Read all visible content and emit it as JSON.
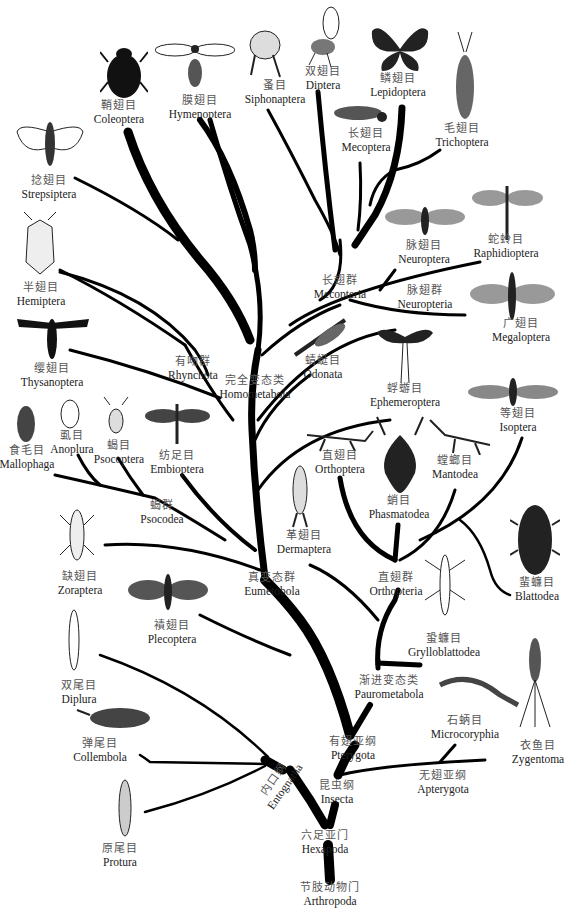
{
  "root": {
    "zh": "节肢动物门",
    "en": "Arthropoda"
  },
  "clades": {
    "hexapoda": {
      "zh": "六足亚门",
      "en": "Hexapoda"
    },
    "insecta": {
      "zh": "昆虫纲",
      "en": "Insecta"
    },
    "entognatha": {
      "zh": "内口纲",
      "en": "Entognatha"
    },
    "pterygota": {
      "zh": "有翅亚纲",
      "en": "Pterygota"
    },
    "apterygota": {
      "zh": "无翅亚纲",
      "en": "Apterygota"
    },
    "paurometabola": {
      "zh": "渐进变态类",
      "en": "Paurometabola"
    },
    "eumetabola": {
      "zh": "真变态群",
      "en": "Eumetobola"
    },
    "orthopteria": {
      "zh": "直翅群",
      "en": "Orthopteria"
    },
    "psocodea": {
      "zh": "蝎群",
      "en": "Psocodea"
    },
    "homometabola": {
      "zh": "完全变态类",
      "en": "Homometabola"
    },
    "rhynchota": {
      "zh": "有吻群",
      "en": "Rhynchota"
    },
    "mecopteria": {
      "zh": "长翅群",
      "en": "Mecopteria"
    },
    "neuropteria": {
      "zh": "脉翅群",
      "en": "Neuropteria"
    }
  },
  "orders": {
    "coleoptera": {
      "zh": "鞘翅目",
      "en": "Coleoptera"
    },
    "hymenoptera": {
      "zh": "膜翅目",
      "en": "Hymenoptera"
    },
    "siphonaptera": {
      "zh": "蚤目",
      "en": "Siphonaptera"
    },
    "diptera": {
      "zh": "双翅目",
      "en": "Diptera"
    },
    "lepidoptera": {
      "zh": "鳞翅目",
      "en": "Lepidoptera"
    },
    "mecoptera": {
      "zh": "长翅目",
      "en": "Mecoptera"
    },
    "trichoptera": {
      "zh": "毛翅目",
      "en": "Trichoptera"
    },
    "strepsiptera": {
      "zh": "捻翅目",
      "en": "Strepsiptera"
    },
    "neuroptera": {
      "zh": "脉翅目",
      "en": "Neuroptera"
    },
    "raphidioptera": {
      "zh": "蛇蛉目",
      "en": "Raphidioptera"
    },
    "megaloptera": {
      "zh": "广翅目",
      "en": "Megaloptera"
    },
    "hemiptera": {
      "zh": "半翅目",
      "en": "Hemiptera"
    },
    "thysanoptera": {
      "zh": "缨翅目",
      "en": "Thysanoptera"
    },
    "odonata": {
      "zh": "蜻蜓目",
      "en": "Odonata"
    },
    "ephemeroptera": {
      "zh": "蜉蝣目",
      "en": "Ephemeroptera"
    },
    "isoptera": {
      "zh": "等翅目",
      "en": "Isoptera"
    },
    "mallophaga": {
      "zh": "食毛目",
      "en": "Mallophaga"
    },
    "anoplura": {
      "zh": "虱目",
      "en": "Anoplura"
    },
    "psocoptera": {
      "zh": "蝎目",
      "en": "Psocoptera"
    },
    "embioptera": {
      "zh": "纺足目",
      "en": "Embioptera"
    },
    "orthoptera": {
      "zh": "直翅目",
      "en": "Orthoptera"
    },
    "phasmatodea": {
      "zh": "蛸目",
      "en": "Phasmatodea"
    },
    "mantodea": {
      "zh": "螳螂目",
      "en": "Mantodea"
    },
    "blattodea": {
      "zh": "蜚蠊目",
      "en": "Blattodea"
    },
    "dermaptera": {
      "zh": "革翅目",
      "en": "Dermaptera"
    },
    "zoraptera": {
      "zh": "缺翅目",
      "en": "Zoraptera"
    },
    "plecoptera": {
      "zh": "襀翅目",
      "en": "Plecoptera"
    },
    "grylloblattodea": {
      "zh": "蛩蠊目",
      "en": "Grylloblattodea"
    },
    "microcoryphia": {
      "zh": "石蛃目",
      "en": "Microcoryphia"
    },
    "zygentoma": {
      "zh": "衣鱼目",
      "en": "Zygentoma"
    },
    "diplura": {
      "zh": "双尾目",
      "en": "Diplura"
    },
    "collembola": {
      "zh": "弹尾目",
      "en": "Collembola"
    },
    "protura": {
      "zh": "原尾目",
      "en": "Protura"
    }
  }
}
